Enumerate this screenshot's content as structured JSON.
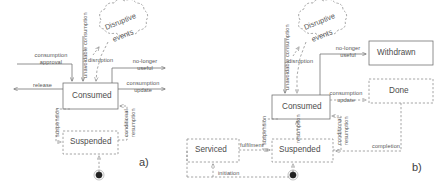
{
  "figure": {
    "type": "state-transition-diagram-pair",
    "panels": [
      {
        "id": "a",
        "caption": "a)"
      },
      {
        "id": "b",
        "caption": "b)"
      }
    ]
  },
  "panel_a": {
    "caption": "a)",
    "states": [
      {
        "id": "consumed",
        "label": "Consumed",
        "style": "solid"
      },
      {
        "id": "suspended",
        "label": "Suspended",
        "style": "dashed"
      }
    ],
    "cloud": {
      "label_line1": "Disruptive",
      "label_line2": "events"
    },
    "initial_marker": "filled-circle",
    "transitions": [
      {
        "id": "consumption-approval",
        "label_line1": "consumption",
        "label_line2": "approval",
        "target": "consumed"
      },
      {
        "id": "unavoidable-consumption",
        "label": "unavoidable consumption",
        "orientation": "vertical",
        "target": "consumed"
      },
      {
        "id": "disruption",
        "label": "disruption",
        "source": "cloud",
        "target": "consumed"
      },
      {
        "id": "no-longer-useful",
        "label_line1": "no-longer",
        "label_line2": "useful",
        "source": "consumed"
      },
      {
        "id": "release",
        "label": "release",
        "source": "consumed"
      },
      {
        "id": "consumption-update",
        "label_line1": "consumption",
        "label_line2": "update",
        "source": "consumed"
      },
      {
        "id": "suspension",
        "label": "suspension",
        "orientation": "vertical",
        "source": "consumed",
        "target": "suspended"
      },
      {
        "id": "conditional-resumption",
        "label_line1": "conditional",
        "label_line2": "resumption",
        "orientation": "vertical",
        "source": "suspended",
        "target": "consumed"
      }
    ]
  },
  "panel_b": {
    "caption": "b)",
    "states": [
      {
        "id": "consumed",
        "label": "Consumed",
        "style": "solid"
      },
      {
        "id": "withdrawn",
        "label": "Withdrawn",
        "style": "solid"
      },
      {
        "id": "done",
        "label": "Done",
        "style": "dashed"
      },
      {
        "id": "suspended",
        "label": "Suspended",
        "style": "dashed"
      },
      {
        "id": "serviced",
        "label": "Serviced",
        "style": "dashed"
      }
    ],
    "cloud": {
      "label_line1": "Disruptive",
      "label_line2": "events"
    },
    "initial_marker": "filled-circle",
    "transitions": [
      {
        "id": "unavoidable-consumption",
        "label": "unavoidable consumption",
        "orientation": "vertical",
        "target": "consumed"
      },
      {
        "id": "disruption",
        "label": "disruption",
        "source": "cloud",
        "target": "consumed"
      },
      {
        "id": "no-longer-useful",
        "label_line1": "no-longer",
        "label_line2": "useful",
        "source": "consumed",
        "target": "withdrawn"
      },
      {
        "id": "consumption-update",
        "label_line1": "consumption",
        "label_line2": "update",
        "source": "consumed",
        "target": "done"
      },
      {
        "id": "suspension",
        "label": "suspension",
        "orientation": "vertical",
        "source": "consumed",
        "target": "suspended"
      },
      {
        "id": "resumption",
        "label": "resumption",
        "orientation": "vertical",
        "source": "suspended",
        "target": "consumed"
      },
      {
        "id": "conditional-resumption",
        "label_line1": "conditional",
        "label_line2": "resumption",
        "orientation": "vertical",
        "source": "suspended",
        "target": "consumed"
      },
      {
        "id": "fulfilment",
        "label": "fulfilment",
        "source": "serviced",
        "target": "suspended"
      },
      {
        "id": "initiation",
        "label": "initiation",
        "target": "serviced"
      },
      {
        "id": "completion",
        "label": "completion",
        "source": "done",
        "target": "suspended"
      }
    ]
  },
  "colors": {
    "stroke": "#6b6b6b",
    "text": "#4d4d4d",
    "background": "#ffffff"
  }
}
